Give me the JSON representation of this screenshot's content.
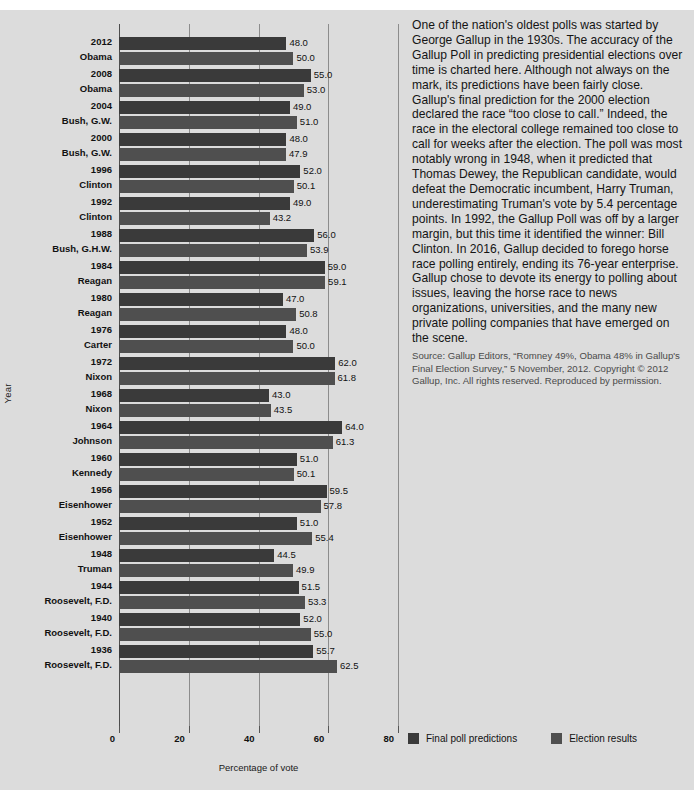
{
  "chart_data": {
    "type": "bar",
    "orientation": "horizontal",
    "title": "",
    "xlabel": "Percentage of vote",
    "ylabel": "Year",
    "xlim": [
      0,
      80
    ],
    "xticks": [
      0,
      20,
      40,
      60,
      80
    ],
    "grid": true,
    "legend_position": "bottom-right",
    "categories": [
      "2012 Obama",
      "2008 Obama",
      "2004 Bush, G.W.",
      "2000 Bush, G.W.",
      "1996 Clinton",
      "1992 Clinton",
      "1988 Bush, G.H.W.",
      "1984 Reagan",
      "1980 Reagan",
      "1976 Carter",
      "1972 Nixon",
      "1968 Nixon",
      "1964 Johnson",
      "1960 Kennedy",
      "1956 Eisenhower",
      "1952 Eisenhower",
      "1948 Truman",
      "1944 Roosevelt, F.D.",
      "1940 Roosevelt, F.D.",
      "1936 Roosevelt, F.D."
    ],
    "series": [
      {
        "name": "Final poll predictions",
        "color": "#3a3a3a",
        "values": [
          48.0,
          55.0,
          49.0,
          48.0,
          52.0,
          49.0,
          56.0,
          59.0,
          47.0,
          48.0,
          62.0,
          43.0,
          64.0,
          51.0,
          59.5,
          51.0,
          44.5,
          51.5,
          52.0,
          55.7
        ]
      },
      {
        "name": "Election results",
        "color": "#4f4f4f",
        "values": [
          50.0,
          53.0,
          51.0,
          47.9,
          50.1,
          43.2,
          53.9,
          59.1,
          50.8,
          50.0,
          61.8,
          43.5,
          61.3,
          50.1,
          57.8,
          55.4,
          49.9,
          53.3,
          55.0,
          62.5
        ]
      }
    ]
  },
  "groups": [
    {
      "year": "2012",
      "name": "Obama",
      "pred": "48.0",
      "res": "50.0",
      "pred_v": 48.0,
      "res_v": 50.0
    },
    {
      "year": "2008",
      "name": "Obama",
      "pred": "55.0",
      "res": "53.0",
      "pred_v": 55.0,
      "res_v": 53.0
    },
    {
      "year": "2004",
      "name": "Bush, G.W.",
      "pred": "49.0",
      "res": "51.0",
      "pred_v": 49.0,
      "res_v": 51.0
    },
    {
      "year": "2000",
      "name": "Bush, G.W.",
      "pred": "48.0",
      "res": "47.9",
      "pred_v": 48.0,
      "res_v": 47.9
    },
    {
      "year": "1996",
      "name": "Clinton",
      "pred": "52.0",
      "res": "50.1",
      "pred_v": 52.0,
      "res_v": 50.1
    },
    {
      "year": "1992",
      "name": "Clinton",
      "pred": "49.0",
      "res": "43.2",
      "pred_v": 49.0,
      "res_v": 43.2
    },
    {
      "year": "1988",
      "name": "Bush, G.H.W.",
      "pred": "56.0",
      "res": "53.9",
      "pred_v": 56.0,
      "res_v": 53.9
    },
    {
      "year": "1984",
      "name": "Reagan",
      "pred": "59.0",
      "res": "59.1",
      "pred_v": 59.0,
      "res_v": 59.1
    },
    {
      "year": "1980",
      "name": "Reagan",
      "pred": "47.0",
      "res": "50.8",
      "pred_v": 47.0,
      "res_v": 50.8
    },
    {
      "year": "1976",
      "name": "Carter",
      "pred": "48.0",
      "res": "50.0",
      "pred_v": 48.0,
      "res_v": 50.0
    },
    {
      "year": "1972",
      "name": "Nixon",
      "pred": "62.0",
      "res": "61.8",
      "pred_v": 62.0,
      "res_v": 61.8
    },
    {
      "year": "1968",
      "name": "Nixon",
      "pred": "43.0",
      "res": "43.5",
      "pred_v": 43.0,
      "res_v": 43.5
    },
    {
      "year": "1964",
      "name": "Johnson",
      "pred": "64.0",
      "res": "61.3",
      "pred_v": 64.0,
      "res_v": 61.3
    },
    {
      "year": "1960",
      "name": "Kennedy",
      "pred": "51.0",
      "res": "50.1",
      "pred_v": 51.0,
      "res_v": 50.1
    },
    {
      "year": "1956",
      "name": "Eisenhower",
      "pred": "59.5",
      "res": "57.8",
      "pred_v": 59.5,
      "res_v": 57.8
    },
    {
      "year": "1952",
      "name": "Eisenhower",
      "pred": "51.0",
      "res": "55.4",
      "pred_v": 51.0,
      "res_v": 55.4
    },
    {
      "year": "1948",
      "name": "Truman",
      "pred": "44.5",
      "res": "49.9",
      "pred_v": 44.5,
      "res_v": 49.9
    },
    {
      "year": "1944",
      "name": "Roosevelt, F.D.",
      "pred": "51.5",
      "res": "53.3",
      "pred_v": 51.5,
      "res_v": 53.3
    },
    {
      "year": "1940",
      "name": "Roosevelt, F.D.",
      "pred": "52.0",
      "res": "55.0",
      "pred_v": 52.0,
      "res_v": 55.0
    },
    {
      "year": "1936",
      "name": "Roosevelt, F.D.",
      "pred": "55.7",
      "res": "62.5",
      "pred_v": 55.7,
      "res_v": 62.5
    }
  ],
  "axes": {
    "x_title": "Percentage of vote",
    "y_title": "Year",
    "x_ticks": [
      "0",
      "20",
      "40",
      "60",
      "80"
    ],
    "x_tick_values": [
      0,
      20,
      40,
      60,
      80
    ]
  },
  "legend": {
    "items": [
      {
        "label": "Final poll predictions",
        "color": "#3a3a3a"
      },
      {
        "label": "Election results",
        "color": "#4f4f4f"
      }
    ]
  },
  "text_panel": {
    "body": "One of the nation's oldest polls was started by George Gallup in the 1930s. The accuracy of the Gallup Poll in predicting presidential elections over time is charted here. Although not always on the mark, its predictions have been fairly close. Gallup's final prediction for the 2000 election declared the race “too close to call.” Indeed, the race in the electoral college remained too close to call for weeks after the election. The poll was most notably wrong in 1948, when it predicted that Thomas Dewey, the Republican candidate, would defeat the Democratic incumbent, Harry Truman, underestimating Truman's vote by 5.4 percentage points. In 1992, the Gallup Poll was off by a larger margin, but this time it identified the winner: Bill Clinton. In 2016, Gallup decided to forego horse race polling entirely, ending its 76-year enterprise. Gallup chose to devote its energy to polling about issues, leaving the horse race to news organizations, universities, and the many new private polling companies that have emerged on the scene.",
    "source": "Source: Gallup Editors, “Romney 49%, Obama 48% in Gallup's Final Election Survey,” 5 November, 2012. Copyright © 2012 Gallup, Inc. All rights reserved. Reproduced by permission."
  },
  "colors": {
    "background": "#dcdcdc",
    "prediction_bar": "#3a3a3a",
    "result_bar": "#4f4f4f",
    "gridline": "#8c8c8c"
  }
}
